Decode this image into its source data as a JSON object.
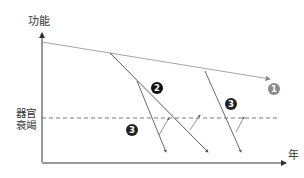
{
  "diagram": {
    "y_axis_label": "功能",
    "x_axis_label": "年",
    "threshold_label": "器官衰竭",
    "badges": [
      {
        "id": "1",
        "text": "1",
        "color": "#8a8a8a",
        "x": 274,
        "y": 89
      },
      {
        "id": "2",
        "text": "2",
        "color": "#111111",
        "x": 157,
        "y": 88
      },
      {
        "id": "3a",
        "text": "3",
        "color": "#222222",
        "x": 231,
        "y": 104
      },
      {
        "id": "3b",
        "text": "3",
        "color": "#222222",
        "x": 132,
        "y": 130
      }
    ],
    "colors": {
      "axis": "#333333",
      "baseline": "#9a9a9a",
      "decline": "#444444",
      "threshold": "#555555"
    }
  }
}
